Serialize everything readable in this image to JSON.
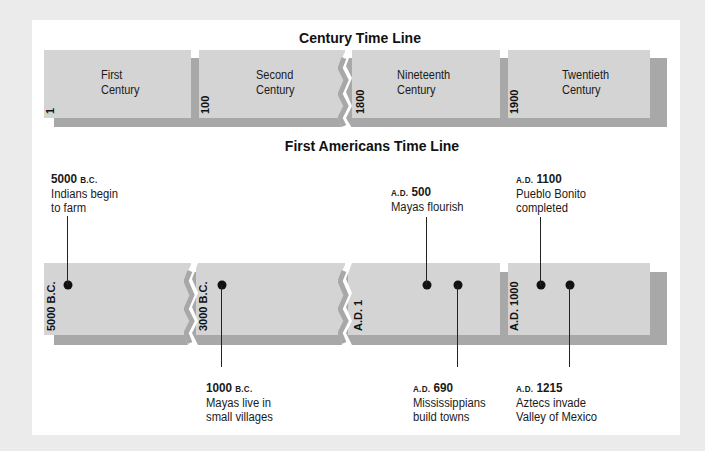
{
  "century_timeline": {
    "title": "Century Time Line",
    "segments": [
      {
        "name": "First Century",
        "line1": "First",
        "line2": "Century",
        "start": "1"
      },
      {
        "name": "Second Century",
        "line1": "Second",
        "line2": "Century",
        "start": "100"
      },
      {
        "name": "Nineteenth Century",
        "line1": "Nineteenth",
        "line2": "Century",
        "start": "1800"
      },
      {
        "name": "Twentieth Century",
        "line1": "Twentieth",
        "line2": "Century",
        "start": "1900"
      }
    ]
  },
  "americans_timeline": {
    "title": "First Americans Time Line",
    "segment_starts": [
      "5000 B.C.",
      "3000 B.C.",
      "A.D. 1",
      "A.D. 1000"
    ],
    "events": [
      {
        "era": "B.C.",
        "year": "5000",
        "era_position": "after",
        "line1": "Indians begin",
        "line2": "to farm",
        "placement": "above"
      },
      {
        "era": "B.C.",
        "year": "1000",
        "era_position": "after",
        "line1": "Mayas live in",
        "line2": "small villages",
        "placement": "below"
      },
      {
        "era": "A.D.",
        "year": "500",
        "era_position": "before",
        "line1": "Mayas flourish",
        "line2": "",
        "placement": "above"
      },
      {
        "era": "A.D.",
        "year": "690",
        "era_position": "before",
        "line1": "Mississippians",
        "line2": "build towns",
        "placement": "below"
      },
      {
        "era": "A.D.",
        "year": "1100",
        "era_position": "before",
        "line1": "Pueblo Bonito",
        "line2": "completed",
        "placement": "above"
      },
      {
        "era": "A.D.",
        "year": "1215",
        "era_position": "before",
        "line1": "Aztecs invade",
        "line2": "Valley of Mexico",
        "placement": "below"
      }
    ]
  },
  "colors": {
    "background": "#ebebeb",
    "panel": "#ffffff",
    "segment": "#d4d4d4",
    "shadow": "#a8a8a8",
    "dot": "#111111"
  }
}
